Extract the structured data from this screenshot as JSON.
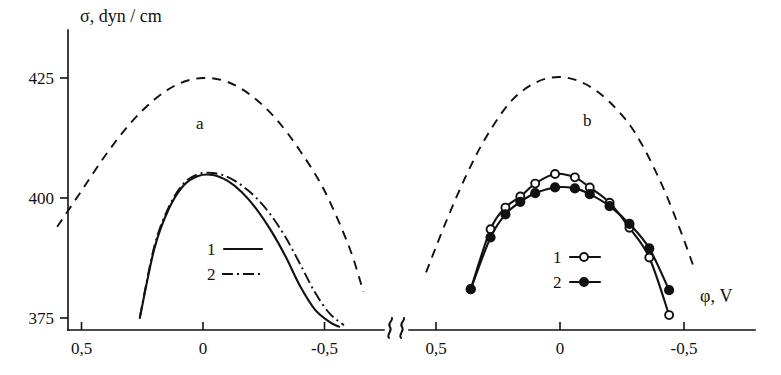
{
  "figure": {
    "ylabel": "σ, dyn / cm",
    "xlabel": "φ, V",
    "panel_a_label": "a",
    "panel_b_label": "b"
  },
  "yaxis": {
    "ticks": [
      {
        "value": 425,
        "label": "425"
      },
      {
        "value": 400,
        "label": "400"
      },
      {
        "value": 375,
        "label": "375"
      }
    ]
  },
  "xaxis": {
    "panel_a_ticks": [
      {
        "value": 0.5,
        "label": "0,5"
      },
      {
        "value": 0.0,
        "label": "0"
      },
      {
        "value": -0.5,
        "label": "-0,5"
      }
    ],
    "panel_b_ticks": [
      {
        "value": 0.5,
        "label": "0,5"
      },
      {
        "value": 0.0,
        "label": "0"
      },
      {
        "value": -0.5,
        "label": "-0,5"
      }
    ],
    "break_symbol": "⸎"
  },
  "legend_a": [
    {
      "key": "1",
      "label": "1",
      "style": "solid"
    },
    {
      "key": "2",
      "label": "2",
      "style": "dashdot"
    }
  ],
  "legend_b": [
    {
      "key": "1",
      "label": "1",
      "marker": "open-circle"
    },
    {
      "key": "2",
      "label": "2",
      "marker": "filled-circle"
    }
  ],
  "chart_data": {
    "type": "line",
    "title": "",
    "xlabel": "φ, V",
    "ylabel": "σ, dyn / cm",
    "xlim": [
      0.62,
      -0.72
    ],
    "ylim": [
      373.0,
      430.0
    ],
    "x_axis_direction": "decreasing",
    "grid": false,
    "legend_position": "inside",
    "panels": [
      {
        "id": "a",
        "label": "a",
        "series": [
          {
            "name": "reference",
            "style": "dashed",
            "marker": "none",
            "x": [
              0.6,
              0.5,
              0.4,
              0.3,
              0.2,
              0.1,
              0.0,
              -0.1,
              -0.2,
              -0.3,
              -0.4,
              -0.5,
              -0.6,
              -0.66
            ],
            "y": [
              394.0,
              401.5,
              409.0,
              415.5,
              420.5,
              423.8,
              425.0,
              424.2,
              421.3,
              416.5,
              409.8,
              401.5,
              390.0,
              380.5
            ]
          },
          {
            "name": "1",
            "style": "solid",
            "marker": "none",
            "x": [
              0.26,
              0.2,
              0.14,
              0.08,
              0.02,
              -0.04,
              -0.1,
              -0.16,
              -0.22,
              -0.28,
              -0.34,
              -0.4,
              -0.46,
              -0.52,
              -0.56
            ],
            "y": [
              375.0,
              389.5,
              397.8,
              402.6,
              404.6,
              404.8,
              403.6,
              401.2,
              397.7,
              393.2,
              387.8,
              381.6,
              376.8,
              374.2,
              373.2
            ]
          },
          {
            "name": "2",
            "style": "dashdot",
            "marker": "none",
            "x": [
              0.26,
              0.2,
              0.14,
              0.08,
              0.02,
              -0.04,
              -0.1,
              -0.16,
              -0.22,
              -0.28,
              -0.34,
              -0.4,
              -0.46,
              -0.52,
              -0.58
            ],
            "y": [
              375.2,
              390.0,
              398.2,
              403.0,
              405.0,
              405.2,
              404.4,
              402.6,
              400.0,
              396.4,
              391.8,
              386.2,
              380.4,
              376.0,
              373.5
            ]
          }
        ]
      },
      {
        "id": "b",
        "label": "b",
        "series": [
          {
            "name": "reference",
            "style": "dashed",
            "marker": "none",
            "x": [
              0.54,
              0.46,
              0.38,
              0.3,
              0.2,
              0.1,
              0.0,
              -0.1,
              -0.2,
              -0.3,
              -0.4,
              -0.48,
              -0.54
            ],
            "y": [
              384.5,
              395.0,
              404.5,
              412.5,
              420.0,
              424.0,
              425.2,
              423.8,
              420.0,
              413.8,
              404.0,
              394.0,
              385.5
            ]
          },
          {
            "name": "1",
            "style": "solid",
            "marker": "open-circle",
            "x": [
              0.36,
              0.28,
              0.22,
              0.16,
              0.1,
              0.02,
              -0.06,
              -0.12,
              -0.2,
              -0.28,
              -0.36,
              -0.44
            ],
            "y": [
              381.0,
              393.5,
              398.0,
              400.3,
              403.0,
              405.0,
              404.3,
              402.2,
              399.0,
              393.8,
              387.6,
              375.6
            ]
          },
          {
            "name": "2",
            "style": "solid",
            "marker": "filled-circle",
            "x": [
              0.36,
              0.28,
              0.22,
              0.16,
              0.1,
              0.02,
              -0.06,
              -0.12,
              -0.2,
              -0.28,
              -0.36,
              -0.44
            ],
            "y": [
              381.0,
              391.8,
              396.6,
              399.2,
              401.0,
              402.2,
              402.0,
              400.8,
              398.3,
              394.6,
              389.5,
              380.8
            ]
          }
        ]
      }
    ]
  }
}
